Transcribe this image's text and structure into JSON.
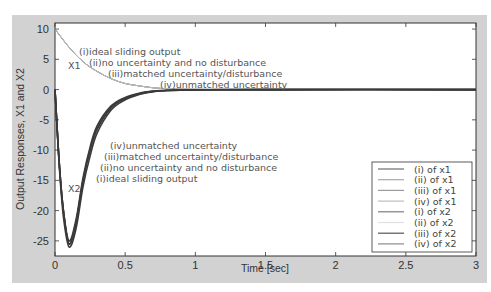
{
  "chart_data": {
    "type": "line",
    "title": "",
    "xlabel": "Time [sec]",
    "ylabel": "Output Responses, X1 and X2",
    "xlim": [
      0,
      3
    ],
    "ylim": [
      -27.5,
      11
    ],
    "xticks": [
      "0",
      "0.5",
      "1",
      "1.5",
      "2",
      "2.5",
      "3"
    ],
    "yticks": [
      "10",
      "5",
      "0",
      "-5",
      "-10",
      "-15",
      "-20",
      "-25"
    ],
    "grid": false,
    "legend_position": "lower right",
    "curve_labels": {
      "x1_name": "X1",
      "x2_name": "X2"
    },
    "annotations_x1": [
      "(i)ideal sliding output",
      "(ii)no uncertainty and no disturbance",
      "(iii)matched uncertainty/disturbance",
      "(iv)unmatched uncertainty"
    ],
    "annotations_x2": [
      "(iv)unmatched uncertainty",
      "(iii)matched uncertainty/disturbance",
      "(ii)no uncertainty and no disturbance",
      "(i)ideal sliding output"
    ],
    "legend": [
      {
        "label": "(i) of x1",
        "color": "#6e6e6e"
      },
      {
        "label": "(ii) of x1",
        "color": "#a8a8a8"
      },
      {
        "label": "(iii) of x1",
        "color": "#9a9a9a"
      },
      {
        "label": "(iv) of x1",
        "color": "#bdbdbd"
      },
      {
        "label": "(i) of x2",
        "color": "#7d7d7d"
      },
      {
        "label": "(ii) of x2",
        "color": "#e0e0e0"
      },
      {
        "label": "(iii) of x2",
        "color": "#555555"
      },
      {
        "label": "(iv) of x2",
        "color": "#8a8a8a"
      }
    ],
    "series": [
      {
        "name": "(i) of x1",
        "x": [
          0,
          0.1,
          0.2,
          0.3,
          0.4,
          0.5,
          0.6,
          0.7,
          0.8,
          1.0,
          1.5,
          2.0,
          3.0
        ],
        "y": [
          10,
          7.0,
          4.6,
          3.0,
          1.8,
          1.0,
          0.6,
          0.3,
          0.15,
          0.05,
          0,
          0,
          0
        ]
      },
      {
        "name": "(ii) of x1",
        "x": [
          0,
          0.1,
          0.2,
          0.3,
          0.4,
          0.5,
          0.6,
          0.7,
          0.8,
          1.0,
          1.5,
          2.0,
          3.0
        ],
        "y": [
          10,
          7.0,
          4.6,
          3.0,
          1.8,
          1.0,
          0.6,
          0.3,
          0.15,
          0.05,
          0,
          0,
          0
        ]
      },
      {
        "name": "(iii) of x1",
        "x": [
          0,
          0.1,
          0.2,
          0.3,
          0.4,
          0.5,
          0.6,
          0.7,
          0.8,
          1.0,
          1.5,
          2.0,
          3.0
        ],
        "y": [
          10,
          7.0,
          4.6,
          3.0,
          1.8,
          1.0,
          0.6,
          0.3,
          0.15,
          0.05,
          0,
          0,
          0
        ]
      },
      {
        "name": "(iv) of x1",
        "x": [
          0,
          0.1,
          0.2,
          0.3,
          0.4,
          0.5,
          0.6,
          0.7,
          0.8,
          1.0,
          1.5,
          2.0,
          3.0
        ],
        "y": [
          10,
          7.0,
          4.6,
          3.0,
          1.8,
          1.0,
          0.6,
          0.3,
          0.15,
          0.05,
          0,
          0,
          0
        ]
      },
      {
        "name": "(i) of x2",
        "x": [
          0,
          0.03,
          0.06,
          0.1,
          0.15,
          0.2,
          0.25,
          0.3,
          0.4,
          0.5,
          0.6,
          0.7,
          0.8,
          1.0,
          1.5,
          3.0
        ],
        "y": [
          0,
          -12,
          -20,
          -25.5,
          -22,
          -15,
          -10,
          -6.5,
          -3,
          -1.5,
          -0.7,
          -0.3,
          -0.15,
          -0.05,
          0,
          0
        ]
      },
      {
        "name": "(ii) of x2",
        "x": [
          0,
          0.03,
          0.06,
          0.1,
          0.15,
          0.2,
          0.25,
          0.3,
          0.4,
          0.5,
          0.6,
          0.7,
          0.8,
          1.0,
          1.5,
          3.0
        ],
        "y": [
          0,
          -12,
          -20,
          -25.5,
          -22,
          -15,
          -10,
          -6.5,
          -3,
          -1.5,
          -0.7,
          -0.3,
          -0.15,
          -0.05,
          0,
          0
        ]
      },
      {
        "name": "(iii) of x2",
        "x": [
          0,
          0.03,
          0.06,
          0.1,
          0.15,
          0.2,
          0.25,
          0.3,
          0.4,
          0.5,
          0.6,
          0.7,
          0.8,
          1.0,
          1.5,
          3.0
        ],
        "y": [
          0,
          -12.5,
          -21,
          -26,
          -23,
          -16,
          -11,
          -7.2,
          -3.4,
          -1.7,
          -0.8,
          -0.35,
          -0.15,
          -0.05,
          0,
          0
        ]
      },
      {
        "name": "(iv) of x2",
        "x": [
          0,
          0.03,
          0.06,
          0.1,
          0.15,
          0.2,
          0.25,
          0.3,
          0.4,
          0.5,
          0.6,
          0.7,
          0.8,
          1.0,
          1.5,
          3.0
        ],
        "y": [
          0,
          -12,
          -20,
          -25,
          -21.5,
          -14.5,
          -9.5,
          -6.0,
          -2.7,
          -1.3,
          -0.6,
          -0.25,
          -0.1,
          -0.03,
          0,
          0
        ]
      }
    ]
  }
}
